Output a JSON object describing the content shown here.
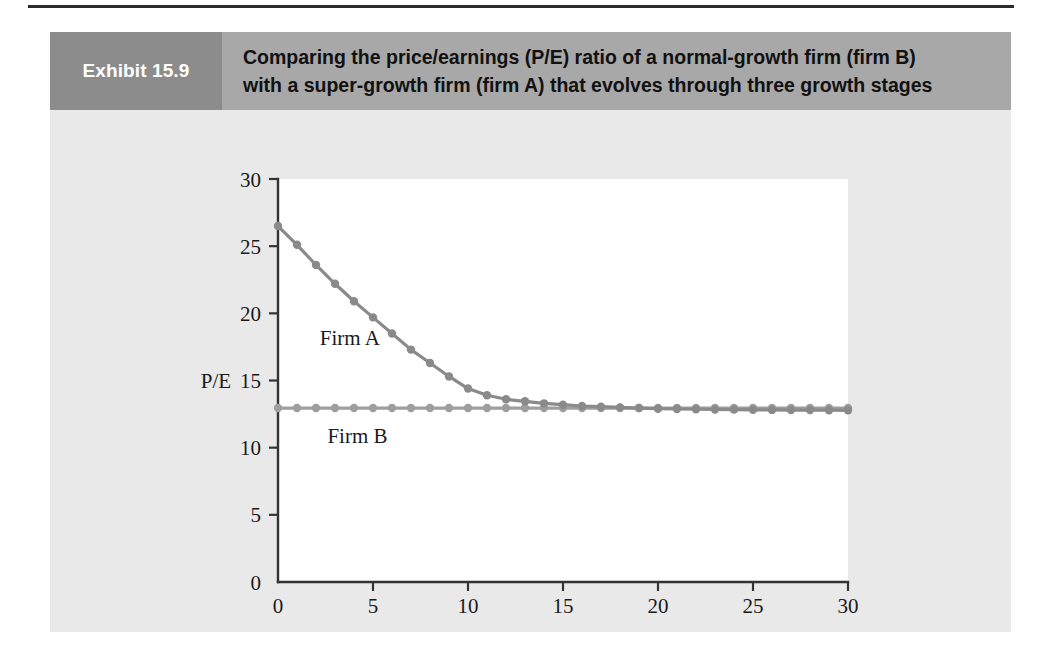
{
  "exhibit": {
    "tag": "Exhibit 15.9",
    "title_line1": "Comparing the price/earnings (P/E) ratio of a normal-growth firm (firm B)",
    "title_line2": "with a super-growth firm (firm A) that evolves through three growth stages",
    "tag_bg": "#8c8c8c",
    "band_bg": "#a8a8a8",
    "panel_bg": "#e9e9e9"
  },
  "chart_data": {
    "type": "line",
    "title": "",
    "xlabel": "Year",
    "ylabel": "P/E",
    "xlim": [
      0,
      30
    ],
    "ylim": [
      0,
      30
    ],
    "xticks": [
      0,
      5,
      10,
      15,
      20,
      25,
      30
    ],
    "yticks": [
      0,
      5,
      10,
      15,
      20,
      25,
      30
    ],
    "grid": false,
    "legend": "inline-annotations",
    "annotations": [
      {
        "text": "Firm A",
        "x": 2.2,
        "y": 18.2
      },
      {
        "text": "Firm B",
        "x": 2.6,
        "y": 10.9
      }
    ],
    "x": [
      0,
      1,
      2,
      3,
      4,
      5,
      6,
      7,
      8,
      9,
      10,
      11,
      12,
      13,
      14,
      15,
      16,
      17,
      18,
      19,
      20,
      21,
      22,
      23,
      24,
      25,
      26,
      27,
      28,
      29,
      30
    ],
    "series": [
      {
        "name": "Firm A",
        "color": "#8a8a8a",
        "values": [
          26.5,
          25.1,
          23.6,
          22.2,
          20.9,
          19.7,
          18.5,
          17.3,
          16.3,
          15.3,
          14.4,
          13.9,
          13.6,
          13.45,
          13.3,
          13.2,
          13.1,
          13.05,
          13.0,
          12.95,
          12.9,
          12.88,
          12.86,
          12.84,
          12.83,
          12.82,
          12.81,
          12.8,
          12.8,
          12.79,
          12.78
        ]
      },
      {
        "name": "Firm B",
        "color": "#9e9e9e",
        "values": [
          12.95,
          12.95,
          12.95,
          12.95,
          12.95,
          12.95,
          12.95,
          12.95,
          12.95,
          12.95,
          12.95,
          12.95,
          12.95,
          12.95,
          12.95,
          12.95,
          12.95,
          12.95,
          12.95,
          12.95,
          12.95,
          12.95,
          12.95,
          12.95,
          12.95,
          12.95,
          12.95,
          12.95,
          12.95,
          12.95,
          12.95
        ]
      }
    ]
  }
}
